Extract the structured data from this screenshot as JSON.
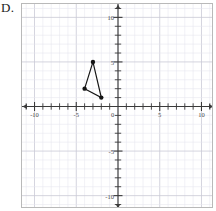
{
  "figure": {
    "choice_label": "D.",
    "background_color": "#ffffff",
    "frame_border_color": "#b9b9b9"
  },
  "chart_data": {
    "type": "scatter",
    "title": "",
    "xlabel": "",
    "ylabel": "",
    "xlim": [
      -11.5,
      11.5
    ],
    "ylim": [
      -11.5,
      11.5
    ],
    "grid": true,
    "minor_grid": true,
    "major_grid_step": 5,
    "minor_grid_step": 1,
    "legend_position": "none",
    "axis_color": "#3a3a3a",
    "grid_major_color": "#c9c9d6",
    "grid_minor_color": "#e6e6ee",
    "tick_step": 1,
    "x_tick_labels": [
      {
        "value": -10,
        "label": "-10"
      },
      {
        "value": -5,
        "label": "-5"
      },
      {
        "value": 5,
        "label": "5"
      },
      {
        "value": 10,
        "label": "10"
      }
    ],
    "y_tick_labels": [
      {
        "value": 10,
        "label": "10"
      },
      {
        "value": 5,
        "label": "5"
      },
      {
        "value": -5,
        "label": "-5"
      },
      {
        "value": -10,
        "label": "-10"
      }
    ],
    "origin_label": "0",
    "series": [
      {
        "name": "triangle",
        "type": "polygon",
        "closed": true,
        "stroke_color": "#151515",
        "marker_color": "#151515",
        "marker_size": 2.2,
        "points": [
          {
            "x": -3,
            "y": 5
          },
          {
            "x": -4,
            "y": 2
          },
          {
            "x": -2,
            "y": 1
          }
        ]
      }
    ]
  }
}
